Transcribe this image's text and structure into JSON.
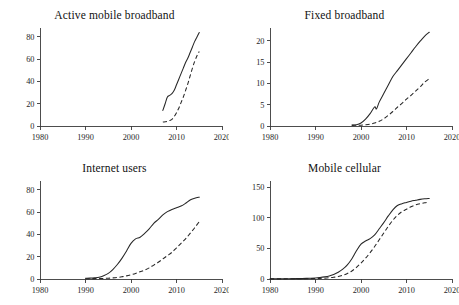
{
  "figure": {
    "background": "#ffffff",
    "line_color": "#262626",
    "axis_color": "#3a3a3a",
    "layout": "2x2 grid of line charts"
  },
  "chart_data": [
    {
      "type": "line",
      "title": "Active mobile broadband",
      "xlabel": "",
      "ylabel": "",
      "xlim": [
        1980,
        2020
      ],
      "ylim": [
        0,
        88
      ],
      "xticks": [
        1980,
        1990,
        2000,
        2010,
        2020
      ],
      "xtick_labels": [
        "1980",
        "1990",
        "2000",
        "2010",
        "2020"
      ],
      "yticks": [
        0,
        20,
        40,
        60,
        80
      ],
      "ytick_labels": [
        "0",
        "20",
        "40",
        "60",
        "80"
      ],
      "grid": false,
      "legend": "none",
      "series": [
        {
          "name": "developed",
          "style": "solid",
          "x": [
            2007,
            2007.5,
            2008,
            2008.5,
            2009,
            2009.5,
            2010,
            2010.5,
            2011,
            2011.5,
            2012,
            2012.5,
            2013,
            2013.5,
            2014,
            2014.5,
            2015
          ],
          "values": [
            14,
            20,
            26,
            27.5,
            29,
            32,
            37,
            42,
            47,
            52,
            57,
            61,
            66,
            71,
            76,
            80,
            84
          ]
        },
        {
          "name": "developing",
          "style": "dashed",
          "x": [
            2007,
            2007.5,
            2008,
            2008.5,
            2009,
            2009.5,
            2010,
            2010.5,
            2011,
            2011.5,
            2012,
            2012.5,
            2013,
            2013.5,
            2014,
            2014.5,
            2015
          ],
          "values": [
            3.5,
            3.8,
            4.2,
            5,
            6,
            8.5,
            12,
            16,
            21,
            26,
            32,
            38,
            45,
            52,
            58,
            63,
            67
          ]
        }
      ]
    },
    {
      "type": "line",
      "title": "Fixed broadband",
      "xlabel": "",
      "ylabel": "",
      "xlim": [
        1980,
        2020
      ],
      "ylim": [
        0,
        23
      ],
      "xticks": [
        1980,
        1990,
        2000,
        2010,
        2020
      ],
      "xtick_labels": [
        "1980",
        "1990",
        "2000",
        "2010",
        "2020"
      ],
      "yticks": [
        0,
        5,
        10,
        15,
        20
      ],
      "ytick_labels": [
        "0",
        "5",
        "10",
        "15",
        "20"
      ],
      "grid": false,
      "legend": "none",
      "series": [
        {
          "name": "developed",
          "style": "solid",
          "x": [
            1998,
            1999,
            2000,
            2001,
            2002,
            2003,
            2003.4,
            2004,
            2005,
            2006,
            2007,
            2008,
            2009,
            2010,
            2011,
            2012,
            2013,
            2014,
            2015
          ],
          "values": [
            0.25,
            0.3,
            0.7,
            1.6,
            2.9,
            4.5,
            4.0,
            5.6,
            7.6,
            9.6,
            11.6,
            13.0,
            14.4,
            15.8,
            17.2,
            18.6,
            19.9,
            21.1,
            22.0
          ]
        },
        {
          "name": "developing",
          "style": "dashed",
          "x": [
            1998,
            1999,
            2000,
            2001,
            2002,
            2003,
            2004,
            2005,
            2006,
            2007,
            2008,
            2009,
            2010,
            2011,
            2012,
            2013,
            2014,
            2015
          ],
          "values": [
            0.15,
            0.18,
            0.2,
            0.3,
            0.45,
            0.7,
            1.1,
            1.7,
            2.5,
            3.4,
            4.4,
            5.3,
            6.3,
            7.2,
            8.2,
            9.2,
            10.3,
            11.1
          ]
        }
      ]
    },
    {
      "type": "line",
      "title": "Internet users",
      "xlabel": "",
      "ylabel": "",
      "xlim": [
        1980,
        2020
      ],
      "ylim": [
        0,
        88
      ],
      "xticks": [
        1980,
        1990,
        2000,
        2010,
        2020
      ],
      "xtick_labels": [
        "1980",
        "1990",
        "2000",
        "2010",
        "2020"
      ],
      "yticks": [
        0,
        20,
        40,
        60,
        80
      ],
      "ytick_labels": [
        "0",
        "20",
        "40",
        "60",
        "80"
      ],
      "grid": false,
      "legend": "none",
      "series": [
        {
          "name": "developed",
          "style": "solid",
          "x": [
            1990,
            1991,
            1992,
            1993,
            1994,
            1995,
            1996,
            1997,
            1998,
            1999,
            2000,
            2001,
            2002,
            2003,
            2004,
            2005,
            2006,
            2007,
            2008,
            2009,
            2010,
            2011,
            2012,
            2013,
            2014,
            2015
          ],
          "values": [
            0.6,
            0.8,
            1.1,
            1.6,
            3.0,
            5.0,
            8.5,
            13.0,
            18.5,
            25.0,
            32.0,
            36.0,
            37.5,
            41.0,
            45.0,
            50.0,
            53.5,
            57.5,
            60.5,
            62.5,
            64.0,
            65.5,
            68.0,
            71.0,
            72.5,
            73.5
          ]
        },
        {
          "name": "developing",
          "style": "dashed",
          "x": [
            1990,
            1991,
            1992,
            1993,
            1994,
            1995,
            1996,
            1997,
            1998,
            1999,
            2000,
            2001,
            2002,
            2003,
            2004,
            2005,
            2006,
            2007,
            2008,
            2009,
            2010,
            2011,
            2012,
            2013,
            2014,
            2015
          ],
          "values": [
            0.3,
            0.3,
            0.35,
            0.4,
            0.5,
            0.7,
            1.0,
            1.4,
            2.0,
            2.8,
            3.8,
            5.0,
            6.5,
            8.0,
            10.0,
            12.5,
            15.0,
            18.0,
            21.0,
            24.0,
            28.0,
            32.0,
            36.0,
            41.0,
            46.0,
            51.5
          ]
        }
      ]
    },
    {
      "type": "line",
      "title": "Mobile cellular",
      "xlabel": "",
      "ylabel": "",
      "xlim": [
        1980,
        2020
      ],
      "ylim": [
        0,
        160
      ],
      "xticks": [
        1980,
        1990,
        2000,
        2010,
        2020
      ],
      "xtick_labels": [
        "1980",
        "1990",
        "2000",
        "2010",
        "2020"
      ],
      "yticks": [
        0,
        50,
        100,
        150
      ],
      "ytick_labels": [
        "0",
        "50",
        "100",
        "150"
      ],
      "grid": false,
      "legend": "none",
      "series": [
        {
          "name": "developed",
          "style": "solid",
          "x": [
            1980,
            1983,
            1986,
            1988,
            1990,
            1991,
            1992,
            1993,
            1994,
            1995,
            1996,
            1997,
            1998,
            1999,
            2000,
            2001,
            2002,
            2003,
            2004,
            2005,
            2006,
            2007,
            2008,
            2009,
            2010,
            2011,
            2012,
            2013,
            2014,
            2015
          ],
          "values": [
            0.3,
            0.4,
            0.6,
            1.0,
            1.8,
            2.5,
            3.5,
            5.0,
            7.5,
            11.0,
            16.0,
            23.0,
            33.0,
            46.0,
            57.0,
            62.0,
            66.0,
            72.0,
            82.0,
            92.0,
            103.0,
            113.0,
            120.0,
            123.0,
            125.0,
            127.0,
            128.5,
            130.0,
            131.0,
            131.5
          ]
        },
        {
          "name": "developing",
          "style": "dashed",
          "x": [
            1980,
            1983,
            1986,
            1988,
            1990,
            1991,
            1992,
            1993,
            1994,
            1995,
            1996,
            1997,
            1998,
            1999,
            2000,
            2001,
            2002,
            2003,
            2004,
            2005,
            2006,
            2007,
            2008,
            2009,
            2010,
            2011,
            2012,
            2013,
            2014,
            2015
          ],
          "values": [
            0.2,
            0.25,
            0.3,
            0.4,
            0.8,
            1.0,
            1.4,
            2.0,
            2.8,
            4.0,
            6.0,
            9.0,
            13.0,
            19.0,
            26.0,
            34.0,
            43.0,
            53.0,
            64.0,
            75.0,
            86.0,
            96.0,
            104.0,
            110.0,
            114.0,
            118.0,
            121.0,
            123.0,
            124.5,
            125.5
          ]
        }
      ]
    }
  ]
}
